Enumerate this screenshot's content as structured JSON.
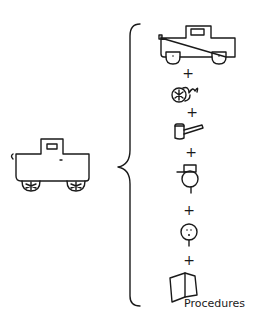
{
  "diagram": {
    "left": {
      "item": "truck",
      "icon": "truck-icon"
    },
    "relation": "brace",
    "right": {
      "components": [
        {
          "name": "truck body",
          "icon": "truck-body-icon"
        },
        {
          "name": "spring/coil",
          "icon": "spring-icon"
        },
        {
          "name": "hammer",
          "icon": "hammer-icon"
        },
        {
          "name": "worker",
          "icon": "worker-icon"
        },
        {
          "name": "person",
          "icon": "person-icon"
        },
        {
          "name": "procedures manual",
          "icon": "book-icon",
          "label": "Procedures"
        }
      ],
      "separator": "+"
    }
  }
}
